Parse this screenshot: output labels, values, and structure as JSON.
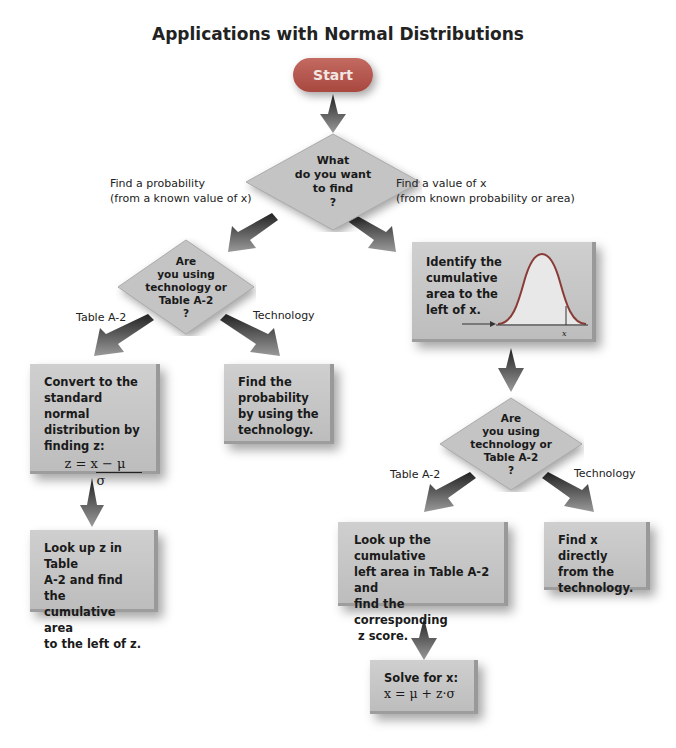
{
  "title": "Applications with Normal Distributions",
  "start": {
    "label": "Start"
  },
  "decision_main": {
    "lines": [
      "What",
      "do you want",
      "to find",
      "?"
    ]
  },
  "branch_left_label": {
    "line1": "Find a probability",
    "line2": "(from a known value of x)"
  },
  "branch_right_label": {
    "line1": "Find a value of x",
    "line2": "(from known probability or area)"
  },
  "left": {
    "decision": {
      "lines": [
        "Are",
        "you using",
        "technology or",
        "Table A-2",
        "?"
      ]
    },
    "table_label": "Table A-2",
    "tech_label": "Technology",
    "convert_box": {
      "lines": [
        "Convert to the",
        "standard normal",
        "distribution by",
        "finding z:"
      ],
      "equation_num": "z = x − μ",
      "equation_den": "σ"
    },
    "tech_box": {
      "lines": [
        "Find the",
        "probability",
        "by using the",
        "technology."
      ]
    },
    "lookup_box": {
      "lines": [
        "Look up z in Table",
        "A-2 and find the",
        "cumulative area",
        "to the left of z."
      ]
    }
  },
  "right": {
    "identify_box": {
      "lines": [
        "Identify the",
        "cumulative",
        "area to the",
        "left of x."
      ],
      "curve_axis_label": "x"
    },
    "decision": {
      "lines": [
        "Are",
        "you using",
        "technology or",
        "Table A-2",
        "?"
      ]
    },
    "table_label": "Table A-2",
    "tech_label": "Technology",
    "lookup_box": {
      "lines": [
        "Look up the cumulative",
        "left area in Table A-2 and",
        "find the corresponding",
        " z score."
      ]
    },
    "tech_box": {
      "lines": [
        "Find x directly",
        "from the",
        "technology."
      ]
    },
    "solve_box": {
      "line1": "Solve for x:",
      "equation": "x = μ + z·σ"
    }
  },
  "colors": {
    "start": "#b0544b",
    "box": "#c6c6c6",
    "arrow": "#6f6f6f",
    "curve": "#8a3b35"
  }
}
